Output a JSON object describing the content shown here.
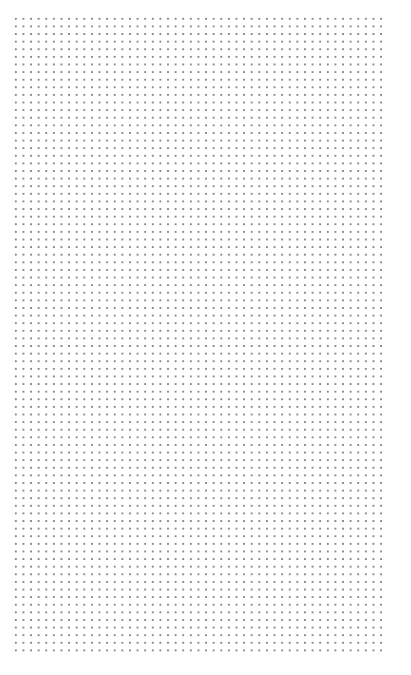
{
  "canvas": {
    "type": "dot-grid",
    "background_color": "#ffffff",
    "dot_color": "#8a8a8a",
    "dot_spacing_px": 7.62,
    "columns": 49,
    "rows": 84
  }
}
